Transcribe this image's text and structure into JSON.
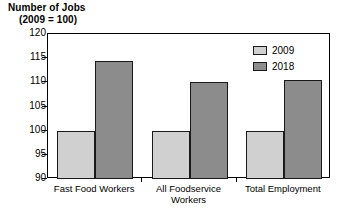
{
  "chart_data": {
    "type": "bar",
    "title": "Number of Jobs",
    "subtitle": "(2009 = 100)",
    "xlabel": "",
    "ylabel": "",
    "ylim": [
      90,
      120
    ],
    "yticks": [
      90,
      95,
      100,
      105,
      110,
      115,
      120
    ],
    "ytick_labels": [
      "90",
      "95",
      "100",
      "105",
      "110",
      "115",
      "120"
    ],
    "grid": false,
    "legend_position": "top-right-inside",
    "categories": [
      "Fast Food Workers",
      "All Foodservice\nWorkers",
      "Total Employment"
    ],
    "series": [
      {
        "name": "2009",
        "color": "#d0d0d0",
        "values": [
          100,
          100,
          100
        ]
      },
      {
        "name": "2018",
        "color": "#8c8c8c",
        "values": [
          114.5,
          110,
          110.5
        ]
      }
    ]
  },
  "legend": {
    "items": [
      {
        "label": "2009",
        "color": "#d0d0d0"
      },
      {
        "label": "2018",
        "color": "#8c8c8c"
      }
    ]
  },
  "colors": {
    "series_2009": "#d0d0d0",
    "series_2018": "#8c8c8c",
    "axis": "#000000",
    "bar_outline": "#1a1a1a",
    "background": "#ffffff"
  }
}
